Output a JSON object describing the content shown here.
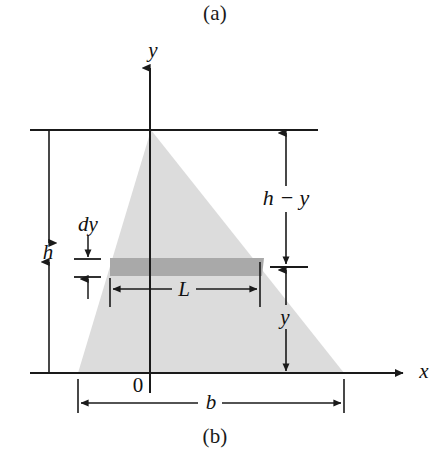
{
  "figure": {
    "caption_a": "(a)",
    "caption_b": "(b)"
  },
  "axes": {
    "y_axis_label": "y",
    "x_axis_label": "x",
    "origin_label": "0"
  },
  "dimensions": {
    "height_label": "h",
    "base_label": "b",
    "strip_thickness_label": "dy",
    "strip_width_label": "L",
    "distance_below_label": "y",
    "distance_above_label": "h − y"
  },
  "colors": {
    "triangle_fill": "#dcdcdc",
    "strip_fill": "#a9a9a9",
    "line_color": "#1a1a1a",
    "background": "#ffffff"
  },
  "geometry": {
    "top_line_y": 130,
    "x_axis_y": 373,
    "y_axis_x": 150,
    "apex_x": 151,
    "base_left_x": 78,
    "base_right_x": 344,
    "strip_top_y": 258,
    "strip_bottom_y": 276,
    "strip_left_x": 110,
    "strip_right_x": 262
  }
}
